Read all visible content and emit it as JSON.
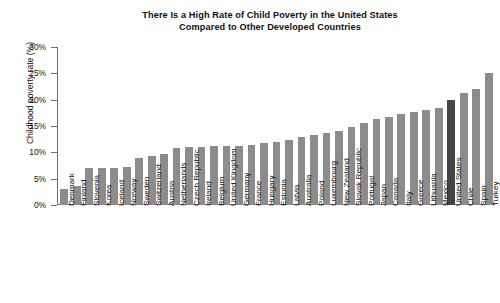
{
  "chart_data": {
    "type": "bar",
    "title": "There Is a High Rate of Child Poverty in the United States Compared to Other Developed Countries",
    "title_line1": "There Is a High Rate of Child Poverty in the United States",
    "title_line2": "Compared to Other Developed Countries",
    "xlabel": "",
    "ylabel": "Childhood poverty rate (%)",
    "ylim": [
      0,
      30
    ],
    "ytick_values": [
      0,
      5,
      10,
      15,
      20,
      25,
      30
    ],
    "ytick_labels": [
      "0%",
      "5%",
      "10%",
      "15%",
      "20%",
      "25%",
      "30%"
    ],
    "grid": false,
    "legend": false,
    "highlight_category": "United States",
    "bar_color": "#8c8c8c",
    "highlight_color": "#454545",
    "categories": [
      "Denmark",
      "Finland",
      "Slovenia",
      "Korea",
      "Iceland",
      "Norway",
      "Sweden",
      "Switzerland",
      "Austria",
      "Netherlands",
      "Czech Republic",
      "Ireland",
      "Belgium",
      "United Kingdom",
      "Germany",
      "France",
      "Hungary",
      "Estonia",
      "Latvia",
      "Australia",
      "Poland",
      "Luxembourg",
      "New Zealand",
      "Slovak Republic",
      "Portugal",
      "Japan",
      "Canada",
      "Italy",
      "Greece",
      "Lithuania",
      "Mexico",
      "United States",
      "Chile",
      "Spain",
      "Turkey"
    ],
    "values": [
      3.0,
      3.7,
      7.0,
      7.1,
      7.1,
      7.2,
      8.9,
      9.4,
      9.7,
      10.9,
      11.0,
      11.0,
      11.2,
      11.3,
      11.3,
      11.4,
      11.8,
      12.0,
      12.4,
      13.0,
      13.2,
      13.6,
      14.0,
      14.9,
      15.6,
      16.3,
      16.8,
      17.3,
      17.6,
      18.0,
      18.5,
      19.9,
      21.2,
      22.1,
      25.0
    ]
  }
}
